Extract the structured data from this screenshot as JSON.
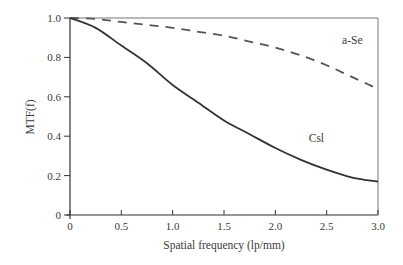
{
  "chart_data": {
    "type": "line",
    "title": "",
    "xlabel": "Spatial frequency (lp/mm)",
    "ylabel": "MTF(f)",
    "xlim": [
      0,
      3.0
    ],
    "ylim": [
      0,
      1.0
    ],
    "grid": false,
    "legend_position": "inline labels",
    "x_ticks": [
      "0",
      "0.5",
      "1.0",
      "1.5",
      "2.0",
      "2.5",
      "3.0"
    ],
    "y_ticks": [
      "0",
      "0.2",
      "0.4",
      "0.6",
      "0.8",
      "1.0"
    ],
    "x": [
      0,
      0.25,
      0.5,
      0.75,
      1.0,
      1.25,
      1.5,
      1.75,
      2.0,
      2.25,
      2.5,
      2.75,
      3.0
    ],
    "series": [
      {
        "name": "a-Se",
        "style": "dashed",
        "color": "#555555",
        "values": [
          1.0,
          0.995,
          0.98,
          0.965,
          0.95,
          0.93,
          0.91,
          0.88,
          0.85,
          0.81,
          0.76,
          0.7,
          0.64
        ]
      },
      {
        "name": "CsI",
        "style": "solid",
        "color": "#333333",
        "values": [
          1.0,
          0.95,
          0.86,
          0.77,
          0.66,
          0.57,
          0.48,
          0.41,
          0.34,
          0.28,
          0.23,
          0.19,
          0.17
        ]
      }
    ],
    "annotations": [
      {
        "text": "a-Se",
        "x": 2.75,
        "y": 0.87
      },
      {
        "text": "Csl",
        "x": 2.4,
        "y": 0.37
      }
    ]
  }
}
